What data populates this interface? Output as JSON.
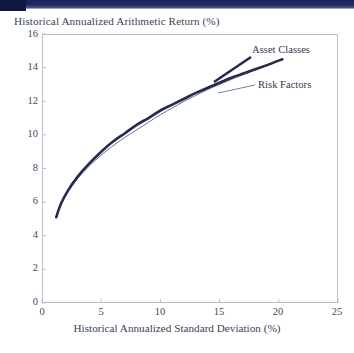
{
  "chart_data": {
    "type": "line",
    "title": "Historical Annualized Arithmetic Return (%)",
    "xlabel": "Historical Annualized Standard Deviation (%)",
    "ylabel": "Historical Annualized Arithmetic Return (%)",
    "xlim": [
      0,
      25
    ],
    "ylim": [
      0,
      16
    ],
    "xticks": [
      0,
      5,
      10,
      15,
      20,
      25
    ],
    "yticks": [
      0,
      2,
      4,
      6,
      8,
      10,
      12,
      14,
      16
    ],
    "grid": false,
    "legend_position": "inline-annotation",
    "series": [
      {
        "name": "Asset Classes",
        "color": "#252b4e",
        "linewidth": 2.6,
        "x": [
          1.2,
          1.6,
          2.2,
          3.0,
          4.0,
          5.0,
          6.0,
          7.0,
          8.0,
          9.0,
          10.0,
          11.0,
          12.0,
          13.0,
          14.0,
          15.0,
          16.0,
          17.0,
          18.0,
          19.0,
          20.3
        ],
        "y": [
          5.1,
          5.9,
          6.7,
          7.5,
          8.3,
          9.0,
          9.6,
          10.1,
          10.6,
          11.0,
          11.45,
          11.8,
          12.15,
          12.5,
          12.8,
          13.1,
          13.4,
          13.65,
          13.9,
          14.15,
          14.5
        ]
      },
      {
        "name": "Risk Factors",
        "color": "#5b6180",
        "linewidth": 0.9,
        "x": [
          1.2,
          1.6,
          2.2,
          3.0,
          4.0,
          5.0,
          6.0,
          7.0,
          8.0,
          9.0,
          10.0,
          11.0,
          12.0,
          13.0,
          14.0,
          15.0,
          16.0,
          17.0,
          18.0,
          19.0,
          20.3
        ],
        "y": [
          5.1,
          5.85,
          6.6,
          7.4,
          8.15,
          8.8,
          9.35,
          9.85,
          10.3,
          10.75,
          11.2,
          11.6,
          12.0,
          12.35,
          12.7,
          13.0,
          13.3,
          13.58,
          13.85,
          14.12,
          14.5
        ]
      }
    ],
    "annotations": [
      {
        "text": "Asset Classes",
        "series": "Asset Classes"
      },
      {
        "text": "Risk Factors",
        "series": "Risk Factors"
      }
    ]
  },
  "axis": {
    "y_tick_labels": [
      "16",
      "14",
      "12",
      "10",
      "8",
      "6",
      "4",
      "2",
      "0"
    ],
    "x_tick_labels": [
      "0",
      "5",
      "10",
      "15",
      "20",
      "25"
    ]
  }
}
